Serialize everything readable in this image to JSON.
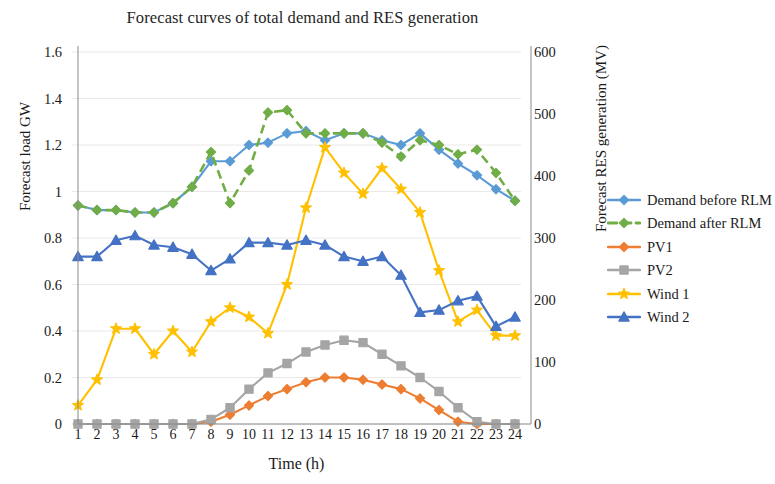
{
  "chart_data": {
    "type": "line",
    "title": "Forecast curves of total demand and RES generation",
    "xlabel": "Time (h)",
    "ylabel": "Forecast load GW",
    "ylabel_secondary": "Forecast RES generation (MV)",
    "x": [
      1,
      2,
      3,
      4,
      5,
      6,
      7,
      8,
      9,
      10,
      11,
      12,
      13,
      14,
      15,
      16,
      17,
      18,
      19,
      20,
      21,
      22,
      23,
      24
    ],
    "xticks": [
      "1",
      "2",
      "3",
      "4",
      "5",
      "6",
      "7",
      "8",
      "9",
      "10",
      "11",
      "12",
      "13",
      "14",
      "15",
      "16",
      "17",
      "18",
      "19",
      "20",
      "21",
      "22",
      "23",
      "24"
    ],
    "yticks_left": [
      "0",
      "0.2",
      "0.4",
      "0.6",
      "0.8",
      "1",
      "1.2",
      "1.4",
      "1.6"
    ],
    "yticks_right": [
      "0",
      "100",
      "200",
      "300",
      "400",
      "500",
      "600"
    ],
    "ylim": [
      0,
      1.6
    ],
    "ylim_secondary": [
      0,
      600
    ],
    "grid": false,
    "legend_position": "right",
    "series": [
      {
        "name": "Demand before RLM",
        "color": "#5B9BD5",
        "axis": "left",
        "dash": false,
        "marker": "diamond",
        "values": [
          0.94,
          0.92,
          0.92,
          0.91,
          0.91,
          0.95,
          1.02,
          1.13,
          1.13,
          1.2,
          1.21,
          1.25,
          1.26,
          1.22,
          1.25,
          1.25,
          1.22,
          1.2,
          1.25,
          1.18,
          1.12,
          1.07,
          1.01,
          0.96
        ]
      },
      {
        "name": "Demand after RLM",
        "color": "#70AD47",
        "axis": "left",
        "dash": true,
        "marker": "diamond",
        "values": [
          0.94,
          0.92,
          0.92,
          0.91,
          0.91,
          0.95,
          1.02,
          1.17,
          0.95,
          1.09,
          1.34,
          1.35,
          1.25,
          1.25,
          1.25,
          1.25,
          1.21,
          1.15,
          1.22,
          1.2,
          1.16,
          1.18,
          1.08,
          0.96
        ]
      },
      {
        "name": "PV1",
        "color": "#ED7D31",
        "axis": "left",
        "dash": false,
        "marker": "diamond",
        "values": [
          0,
          0,
          0,
          0,
          0,
          0,
          0,
          0.01,
          0.04,
          0.08,
          0.12,
          0.15,
          0.18,
          0.2,
          0.2,
          0.19,
          0.17,
          0.15,
          0.11,
          0.06,
          0.01,
          0,
          0,
          0
        ]
      },
      {
        "name": "PV2",
        "color": "#A5A5A5",
        "axis": "left",
        "dash": false,
        "marker": "square",
        "values": [
          0,
          0,
          0,
          0,
          0,
          0,
          0,
          0.02,
          0.07,
          0.15,
          0.22,
          0.26,
          0.31,
          0.34,
          0.36,
          0.35,
          0.3,
          0.25,
          0.2,
          0.14,
          0.07,
          0.01,
          0,
          0
        ]
      },
      {
        "name": "Wind 1",
        "color": "#FFC000",
        "axis": "left",
        "dash": false,
        "marker": "star",
        "values": [
          0.08,
          0.19,
          0.41,
          0.41,
          0.3,
          0.4,
          0.31,
          0.44,
          0.5,
          0.46,
          0.39,
          0.6,
          0.93,
          1.19,
          1.08,
          0.99,
          1.1,
          1.01,
          0.91,
          0.66,
          0.44,
          0.49,
          0.38,
          0.38
        ]
      },
      {
        "name": "Wind 2",
        "color": "#4472C4",
        "axis": "left",
        "dash": false,
        "marker": "triangle",
        "values": [
          0.72,
          0.72,
          0.79,
          0.81,
          0.77,
          0.76,
          0.73,
          0.66,
          0.71,
          0.78,
          0.78,
          0.77,
          0.79,
          0.77,
          0.72,
          0.7,
          0.72,
          0.64,
          0.48,
          0.49,
          0.53,
          0.55,
          0.42,
          0.46
        ]
      }
    ]
  },
  "legend": {
    "items": [
      {
        "label": "Demand before RLM"
      },
      {
        "label": "Demand after RLM"
      },
      {
        "label": "PV1"
      },
      {
        "label": "PV2"
      },
      {
        "label": "Wind 1"
      },
      {
        "label": "Wind 2"
      }
    ]
  }
}
